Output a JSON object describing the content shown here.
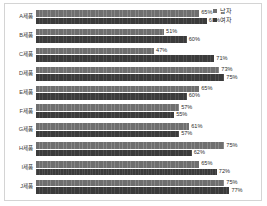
{
  "chart_data": {
    "type": "bar",
    "orientation": "horizontal",
    "title": "",
    "xlabel": "",
    "ylabel": "",
    "xlim": [
      0,
      88
    ],
    "grid": false,
    "legend_position": "top-right",
    "value_suffix": "%",
    "categories": [
      "A제품",
      "B제품",
      "C제품",
      "D제품",
      "E제품",
      "F제품",
      "G제품",
      "H제품",
      "I제품",
      "J제품"
    ],
    "series": [
      {
        "name": "남자",
        "color": "#6f6f6f",
        "values": [
          65,
          51,
          47,
          73,
          65,
          57,
          61,
          75,
          65,
          75
        ]
      },
      {
        "name": "여자",
        "color": "#3b3b3b",
        "values": [
          68,
          60,
          71,
          75,
          60,
          55,
          57,
          62,
          72,
          77
        ]
      }
    ],
    "labels": {
      "남자": [
        "65%",
        "51%",
        "47%",
        "73%",
        "65%",
        "57%",
        "61%",
        "75%",
        "65%",
        "75%"
      ],
      "여자": [
        "68%",
        "60%",
        "71%",
        "75%",
        "60%",
        "55%",
        "57%",
        "62%",
        "72%",
        "77%"
      ]
    }
  },
  "legend": {
    "entries": [
      {
        "label": "남자",
        "marker": "square-marker"
      },
      {
        "label": "여자",
        "marker": "square-marker"
      }
    ]
  }
}
